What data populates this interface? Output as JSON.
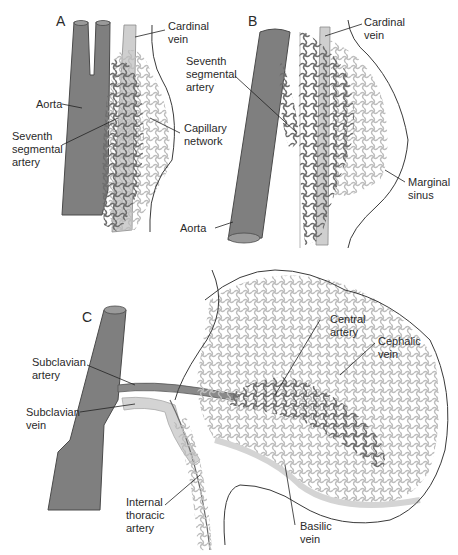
{
  "figure": {
    "panels": [
      {
        "id": "A",
        "label": "A",
        "annotations": [
          {
            "text_lines": [
              "Cardinal",
              "vein"
            ]
          },
          {
            "text_lines": [
              "Aorta"
            ]
          },
          {
            "text_lines": [
              "Seventh",
              "segmental",
              "artery"
            ]
          },
          {
            "text_lines": [
              "Capillary",
              "network"
            ]
          }
        ]
      },
      {
        "id": "B",
        "label": "B",
        "annotations": [
          {
            "text_lines": [
              "Cardinal",
              "vein"
            ]
          },
          {
            "text_lines": [
              "Seventh",
              "segmental",
              "artery"
            ]
          },
          {
            "text_lines": [
              "Marginal",
              "sinus"
            ]
          },
          {
            "text_lines": [
              "Aorta"
            ]
          }
        ]
      },
      {
        "id": "C",
        "label": "C",
        "annotations": [
          {
            "text_lines": [
              "Central",
              "artery"
            ]
          },
          {
            "text_lines": [
              "Cephalic",
              "vein"
            ]
          },
          {
            "text_lines": [
              "Subclavian",
              "artery"
            ]
          },
          {
            "text_lines": [
              "Subclavian",
              "vein"
            ]
          },
          {
            "text_lines": [
              "Internal",
              "thoracic",
              "artery"
            ]
          },
          {
            "text_lines": [
              "Basilic",
              "vein"
            ]
          }
        ]
      }
    ],
    "colors": {
      "artery": "#7a7a7a",
      "artery_dark": "#5a5a5a",
      "vein": "#c8c8c8",
      "vein_light": "#dedede",
      "outline": "#3a3a3a",
      "text": "#2a2a2a"
    }
  }
}
